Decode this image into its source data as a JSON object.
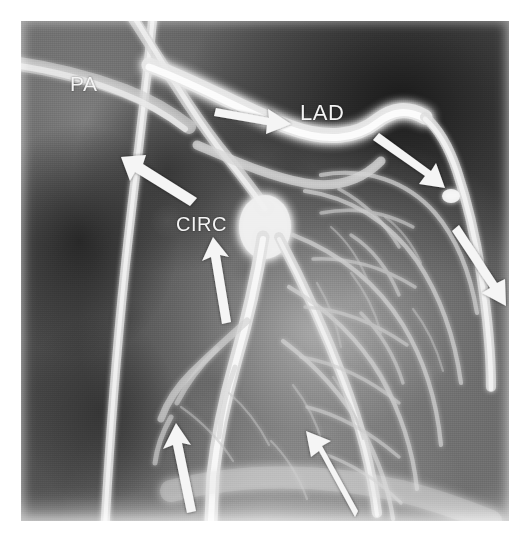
{
  "figure": {
    "kind": "coronary-angiogram",
    "modality_note": "grayscale radiographic film image",
    "width": 530,
    "height": 539,
    "plate": {
      "x": 21,
      "y": 21,
      "width": 488,
      "height": 500
    },
    "background_color": "#ffffff",
    "annotation_color": "#f2f2f2"
  },
  "labels": [
    {
      "id": "pa",
      "text": "PA",
      "x": 70,
      "y": 72,
      "font_size": 21,
      "meaning": "pulmonary artery"
    },
    {
      "id": "lad",
      "text": "LAD",
      "x": 300,
      "y": 100,
      "font_size": 22,
      "meaning": "left anterior descending coronary artery"
    },
    {
      "id": "circ",
      "text": "CIRC",
      "x": 176,
      "y": 213,
      "font_size": 20,
      "meaning": "circumflex coronary artery"
    }
  ],
  "arrows": [
    {
      "id": "arrow-lad-proximal",
      "direction": "right",
      "angle_deg": 8,
      "tail_x": 216,
      "tail_y": 108,
      "tip_x": 291,
      "tip_y": 124,
      "length": 77
    },
    {
      "id": "arrow-circ-upper",
      "direction": "up-left",
      "angle_deg": 205,
      "tail_x": 196,
      "tail_y": 193,
      "tip_x": 131,
      "tip_y": 160,
      "length": 73
    },
    {
      "id": "arrow-lad-distal",
      "direction": "down-right",
      "angle_deg": 40,
      "tail_x": 382,
      "tail_y": 139,
      "tip_x": 446,
      "tip_y": 186,
      "length": 79
    },
    {
      "id": "arrow-marginal-right",
      "direction": "down-right",
      "angle_deg": 58,
      "tail_x": 466,
      "tail_y": 233,
      "tip_x": 507,
      "tip_y": 294,
      "length": 73
    },
    {
      "id": "arrow-circ-mid",
      "direction": "up",
      "angle_deg": 281,
      "tail_x": 224,
      "tail_y": 322,
      "tip_x": 213,
      "tip_y": 251,
      "length": 72
    },
    {
      "id": "arrow-distal-left",
      "direction": "up",
      "angle_deg": 283,
      "tail_x": 190,
      "tail_y": 510,
      "tip_x": 175,
      "tip_y": 438,
      "length": 74
    },
    {
      "id": "arrow-distal-right",
      "direction": "up-left",
      "angle_deg": 249,
      "tail_x": 352,
      "tail_y": 513,
      "tip_x": 316,
      "tip_y": 443,
      "length": 79
    }
  ],
  "vessels": [
    {
      "id": "pa-trunk-vertical",
      "role": "vertical catheter/vessel running top to bottom on the left third"
    },
    {
      "id": "pa-branch-oblique",
      "role": "oblique branch from upper-left toward the central bifurcation"
    },
    {
      "id": "lad-main",
      "role": "bright artery arcing left-to-right across the upper third"
    },
    {
      "id": "circ-main",
      "role": "artery descending from the central bifurcation toward lower middle"
    },
    {
      "id": "diagonal-branches",
      "role": "fine branching mesh filling the right and lower right territory"
    }
  ]
}
